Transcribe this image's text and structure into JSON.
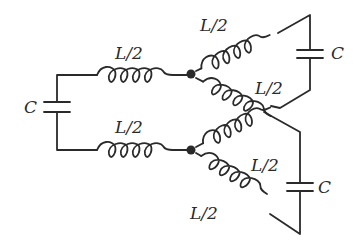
{
  "diagram": {
    "type": "circuit",
    "labels": {
      "cap_left": "C",
      "cap_upper_right": "C",
      "cap_lower_right": "C",
      "ind_top_left": "L/2",
      "ind_bottom_left": "L/2",
      "ind_upper_right_top": "L/2",
      "ind_upper_right_bottom": "L/2",
      "ind_lower_right_top": "L/2",
      "ind_lower_right_bottom": "L/2"
    },
    "colors": {
      "stroke": "#2a2a2a",
      "background": "#ffffff"
    },
    "components": [
      {
        "kind": "capacitor",
        "label": "C",
        "position": "left"
      },
      {
        "kind": "inductor",
        "label": "L/2",
        "position": "top-left"
      },
      {
        "kind": "inductor",
        "label": "L/2",
        "position": "bottom-left"
      },
      {
        "kind": "junction",
        "position": "upper-center"
      },
      {
        "kind": "junction",
        "position": "lower-center"
      },
      {
        "kind": "inductor",
        "label": "L/2",
        "position": "upper-right-top"
      },
      {
        "kind": "inductor",
        "label": "L/2",
        "position": "upper-right-bottom"
      },
      {
        "kind": "capacitor",
        "label": "C",
        "position": "upper-right"
      },
      {
        "kind": "inductor",
        "label": "L/2",
        "position": "lower-right-top"
      },
      {
        "kind": "inductor",
        "label": "L/2",
        "position": "lower-right-bottom"
      },
      {
        "kind": "capacitor",
        "label": "C",
        "position": "lower-right"
      }
    ]
  }
}
